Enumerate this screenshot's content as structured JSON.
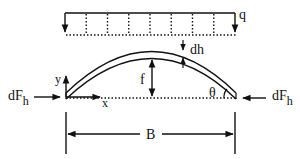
{
  "diagram": {
    "type": "arch-free-body-diagram",
    "labels": {
      "load": "q",
      "rib_thickness": "dh",
      "rise": "f",
      "span": "B",
      "angle": "θ",
      "y_axis": "y",
      "x_axis": "x",
      "force_left_main": "dF",
      "force_left_sub": "h",
      "force_right_main": "dF",
      "force_right_sub": "h"
    },
    "distributed_load": {
      "interior_lines": 7,
      "style": "dotted"
    },
    "colors": {
      "stroke": "#111111",
      "background": "#ffffff"
    }
  }
}
